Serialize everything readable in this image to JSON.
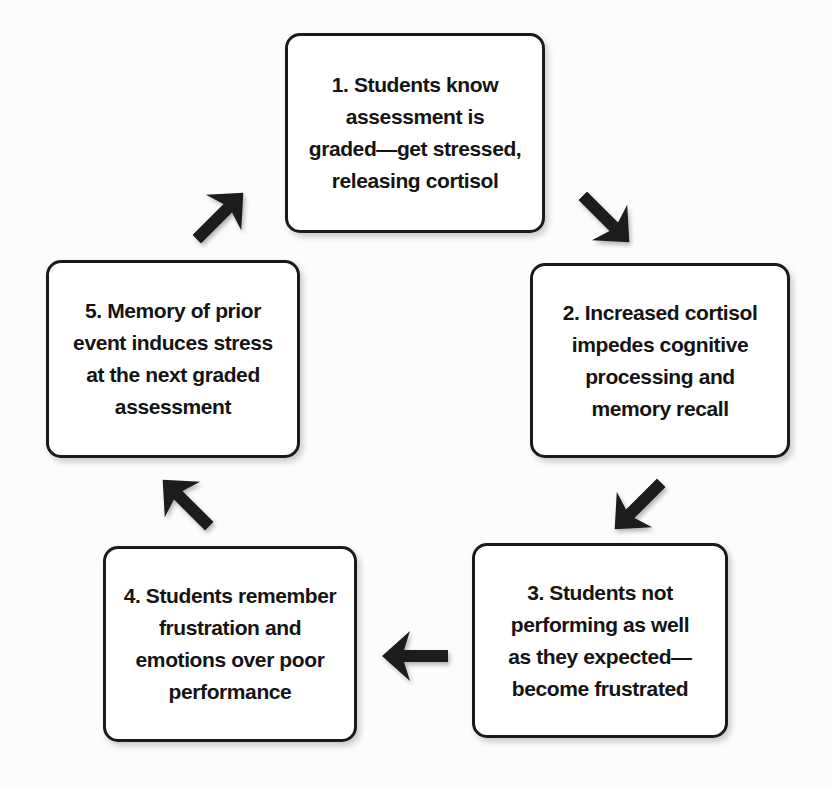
{
  "diagram": {
    "type": "cycle",
    "colors": {
      "background": "#fcfcfc",
      "box_fill": "#ffffff",
      "box_border": "#1a1a1a",
      "text": "#141414",
      "arrow": "#1c1c1c"
    },
    "nodes": [
      {
        "id": "1",
        "lines": [
          "1. Students know",
          "assessment is",
          "graded—get stressed,",
          "releasing cortisol"
        ]
      },
      {
        "id": "2",
        "lines": [
          "2. Increased cortisol",
          "impedes cognitive",
          "processing and",
          "memory recall"
        ]
      },
      {
        "id": "3",
        "lines": [
          "3. Students not",
          "performing as well",
          "as they expected—",
          "become frustrated"
        ]
      },
      {
        "id": "4",
        "lines": [
          "4. Students remember",
          "frustration and",
          "emotions over poor",
          "performance"
        ]
      },
      {
        "id": "5",
        "lines": [
          "5. Memory of prior",
          "event induces stress",
          "at the next graded",
          "assessment"
        ]
      }
    ],
    "arrows": [
      {
        "from": "1",
        "to": "2",
        "direction": "down-right"
      },
      {
        "from": "2",
        "to": "3",
        "direction": "down-left"
      },
      {
        "from": "3",
        "to": "4",
        "direction": "left"
      },
      {
        "from": "4",
        "to": "5",
        "direction": "up-left"
      },
      {
        "from": "5",
        "to": "1",
        "direction": "up-right"
      }
    ]
  }
}
